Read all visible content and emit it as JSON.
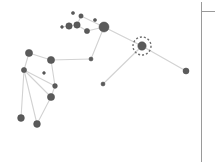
{
  "view": {
    "width": 215,
    "height": 162,
    "background_color": "#ffffff",
    "title": "Node-link network graph"
  },
  "style": {
    "node_color": "#5b5b5b",
    "node_stroke_color": "#4a4a4a",
    "edge_color": "#d2d2d2",
    "edge_width": 1.1,
    "selection_ring_color": "#6e6e6e",
    "divider_color": "#9a9a9a"
  },
  "selection": {
    "selected_node_id": "n20",
    "ring_radius": 9,
    "ring_dash": "2 2"
  },
  "panel": {
    "vertical_divider_x": 201,
    "vertical_divider_top": 2,
    "vertical_divider_bottom": 162,
    "horizontal_divider_y": 11,
    "horizontal_divider_x1": 201,
    "horizontal_divider_x2": 215
  },
  "chart_data": {
    "type": "scatter",
    "title": "",
    "xlabel": "",
    "ylabel": "",
    "xlim": [
      0,
      215
    ],
    "ylim": [
      0,
      162
    ],
    "grid": false,
    "legend": null,
    "layout": "force-directed",
    "node_count": 21,
    "edge_count": 20,
    "nodes": [
      {
        "id": "n1",
        "x": 69,
        "y": 26,
        "r": 3.2,
        "label": ""
      },
      {
        "id": "n2",
        "x": 77,
        "y": 25,
        "r": 3.2,
        "label": ""
      },
      {
        "id": "n3",
        "x": 81,
        "y": 16,
        "r": 2.2,
        "label": ""
      },
      {
        "id": "n4",
        "x": 87,
        "y": 31,
        "r": 2.6,
        "label": ""
      },
      {
        "id": "n5",
        "x": 104,
        "y": 27,
        "r": 5.0,
        "label": ""
      },
      {
        "id": "n6",
        "x": 91,
        "y": 59,
        "r": 2.0,
        "label": ""
      },
      {
        "id": "n7",
        "x": 103,
        "y": 84,
        "r": 2.0,
        "label": ""
      },
      {
        "id": "n8",
        "x": 142,
        "y": 46,
        "r": 4.2,
        "label": ""
      },
      {
        "id": "n9",
        "x": 186,
        "y": 71,
        "r": 3.0,
        "label": ""
      },
      {
        "id": "n10",
        "x": 29,
        "y": 53,
        "r": 3.6,
        "label": ""
      },
      {
        "id": "n11",
        "x": 24,
        "y": 70,
        "r": 2.6,
        "label": ""
      },
      {
        "id": "n12",
        "x": 51,
        "y": 60,
        "r": 3.6,
        "label": ""
      },
      {
        "id": "n13",
        "x": 55,
        "y": 86,
        "r": 2.4,
        "label": ""
      },
      {
        "id": "n14",
        "x": 51,
        "y": 97,
        "r": 3.6,
        "label": ""
      },
      {
        "id": "n15",
        "x": 21,
        "y": 118,
        "r": 3.4,
        "label": ""
      },
      {
        "id": "n16",
        "x": 37,
        "y": 124,
        "r": 3.4,
        "label": ""
      },
      {
        "id": "n17",
        "x": 73,
        "y": 13,
        "r": 1.6,
        "label": ""
      },
      {
        "id": "n18",
        "x": 95,
        "y": 20,
        "r": 1.6,
        "label": ""
      },
      {
        "id": "n19",
        "x": 62,
        "y": 27,
        "r": 1.4,
        "label": ""
      },
      {
        "id": "n20",
        "x": 142,
        "y": 46,
        "r": 4.2,
        "label": ""
      },
      {
        "id": "n21",
        "x": 44,
        "y": 73,
        "r": 1.4,
        "label": ""
      }
    ],
    "edges": [
      {
        "source": "n1",
        "target": "n2"
      },
      {
        "source": "n2",
        "target": "n3"
      },
      {
        "source": "n3",
        "target": "n5"
      },
      {
        "source": "n2",
        "target": "n4"
      },
      {
        "source": "n4",
        "target": "n5"
      },
      {
        "source": "n5",
        "target": "n8"
      },
      {
        "source": "n5",
        "target": "n6"
      },
      {
        "source": "n8",
        "target": "n9"
      },
      {
        "source": "n8",
        "target": "n7"
      },
      {
        "source": "n6",
        "target": "n12"
      },
      {
        "source": "n10",
        "target": "n11"
      },
      {
        "source": "n10",
        "target": "n12"
      },
      {
        "source": "n12",
        "target": "n13"
      },
      {
        "source": "n11",
        "target": "n13"
      },
      {
        "source": "n11",
        "target": "n14"
      },
      {
        "source": "n11",
        "target": "n15"
      },
      {
        "source": "n11",
        "target": "n16"
      },
      {
        "source": "n13",
        "target": "n14"
      },
      {
        "source": "n14",
        "target": "n16"
      },
      {
        "source": "n1",
        "target": "n19"
      }
    ]
  }
}
